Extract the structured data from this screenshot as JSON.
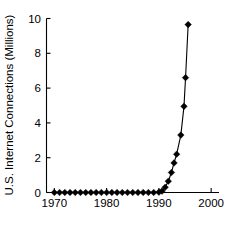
{
  "chart_data": {
    "type": "line",
    "title": "",
    "xlabel": "",
    "ylabel": "U.S. Internet Connections (Millions)",
    "xlim": [
      1968.5,
      2001.5
    ],
    "ylim": [
      0,
      10
    ],
    "xticks": [
      1970,
      1980,
      1990,
      2000
    ],
    "xtick_labels": [
      "1970",
      "1980",
      "1990",
      "2000"
    ],
    "yticks": [
      0,
      2,
      4,
      6,
      8,
      10
    ],
    "ytick_labels": [
      "0",
      "2",
      "4",
      "6",
      "8",
      "10"
    ],
    "grid": false,
    "legend": false,
    "marker": "diamond",
    "line_color": "#000000",
    "marker_color": "#000000",
    "background": "#ffffff",
    "x": [
      1970,
      1971,
      1972,
      1973,
      1974,
      1975,
      1976,
      1977,
      1978,
      1979,
      1980,
      1981,
      1982,
      1983,
      1984,
      1985,
      1986,
      1987,
      1988,
      1989,
      1990,
      1991,
      1992,
      1993,
      1994,
      1995,
      1996
    ],
    "values": [
      0,
      0,
      0,
      0,
      0,
      0,
      0,
      0,
      0,
      0,
      0,
      0,
      0,
      0,
      0,
      0,
      0,
      0,
      0,
      0,
      0.05,
      0.3,
      0.65,
      1.15,
      1.7,
      2.2,
      3.3
    ],
    "series": [
      {
        "name": "U.S. Internet Connections",
        "points": [
          {
            "x": 1970,
            "y": 0
          },
          {
            "x": 1971,
            "y": 0
          },
          {
            "x": 1972,
            "y": 0
          },
          {
            "x": 1973,
            "y": 0
          },
          {
            "x": 1974,
            "y": 0
          },
          {
            "x": 1975,
            "y": 0
          },
          {
            "x": 1976,
            "y": 0
          },
          {
            "x": 1977,
            "y": 0
          },
          {
            "x": 1978,
            "y": 0
          },
          {
            "x": 1979,
            "y": 0
          },
          {
            "x": 1980,
            "y": 0
          },
          {
            "x": 1981,
            "y": 0
          },
          {
            "x": 1982,
            "y": 0
          },
          {
            "x": 1983,
            "y": 0
          },
          {
            "x": 1984,
            "y": 0
          },
          {
            "x": 1985,
            "y": 0
          },
          {
            "x": 1986,
            "y": 0
          },
          {
            "x": 1987,
            "y": 0
          },
          {
            "x": 1988,
            "y": 0
          },
          {
            "x": 1989,
            "y": 0
          },
          {
            "x": 1990,
            "y": 0.02
          },
          {
            "x": 1990.6,
            "y": 0.08
          },
          {
            "x": 1991.2,
            "y": 0.3
          },
          {
            "x": 1991.8,
            "y": 0.65
          },
          {
            "x": 1992.4,
            "y": 1.15
          },
          {
            "x": 1992.9,
            "y": 1.7
          },
          {
            "x": 1993.4,
            "y": 2.2
          },
          {
            "x": 1994.2,
            "y": 3.3
          },
          {
            "x": 1994.8,
            "y": 4.95
          },
          {
            "x": 1995.1,
            "y": 6.6
          },
          {
            "x": 1995.6,
            "y": 9.65
          }
        ]
      }
    ]
  }
}
